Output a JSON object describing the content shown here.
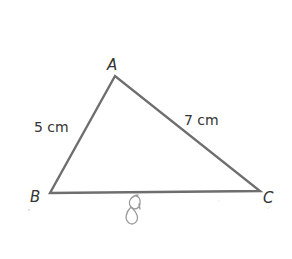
{
  "diagram": {
    "type": "triangle",
    "vertices": [
      {
        "name": "A",
        "x": 115,
        "y": 76
      },
      {
        "name": "B",
        "x": 50,
        "y": 193
      },
      {
        "name": "C",
        "x": 260,
        "y": 191
      }
    ],
    "vertex_labels": {
      "A": "A",
      "B": "B",
      "C": "C"
    },
    "sides": [
      {
        "from": "A",
        "to": "B",
        "label": "5 cm"
      },
      {
        "from": "A",
        "to": "C",
        "label": "7 cm"
      },
      {
        "from": "B",
        "to": "C",
        "label": "8",
        "handwritten": true
      }
    ],
    "side_labels": {
      "ab": "5 cm",
      "ac": "7 cm",
      "bc_handwritten": "8"
    },
    "colors": {
      "edge": "#6e6e6e",
      "text": "#333333",
      "handwriting": "#9a9a9a",
      "background": "#ffffff"
    }
  }
}
